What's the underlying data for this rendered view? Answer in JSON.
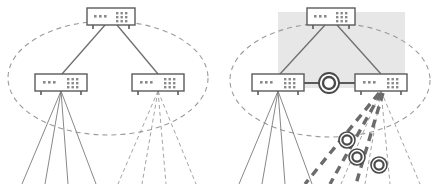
{
  "figure": {
    "caption": "",
    "background_color": "#ffffff",
    "width": 434,
    "height": 184
  },
  "style": {
    "device_stroke": "#5b5b5b",
    "device_fill": "#ffffff",
    "device_port_color": "#808080",
    "solid_link_color": "#6e6e6e",
    "dashed_link_color": "#9a9a9a",
    "thick_dashed_link_color": "#6b6b6b",
    "boundary_ellipse_color": "#9b9b9b",
    "highlight_region_fill": "#e6e6e6",
    "ring_node_outer_stroke": "#4a4a4a",
    "ring_node_inner_stroke": "#4a4a4a",
    "ring_node_fill": "#ffffff"
  },
  "panels": [
    {
      "id": "left-panel",
      "name": "baseline-topology",
      "label": "",
      "has_highlight_region": false,
      "boundary": {
        "name": "domain-boundary-ellipse",
        "cx": 108,
        "cy": 78,
        "rx": 100,
        "ry": 57,
        "dashed": true
      },
      "devices": [
        {
          "id": "L-root",
          "name": "core-switch",
          "x": 87,
          "y": 8,
          "w": 48,
          "h": 17,
          "left_ports": 3,
          "right_port_grid": [
            3,
            3
          ]
        },
        {
          "id": "L-left",
          "name": "edge-switch-left",
          "x": 35,
          "y": 74,
          "w": 52,
          "h": 17,
          "left_ports": 3,
          "right_port_grid": [
            3,
            3
          ]
        },
        {
          "id": "L-right",
          "name": "edge-switch-right",
          "x": 132,
          "y": 74,
          "w": 52,
          "h": 17,
          "left_ports": 3,
          "right_port_grid": [
            3,
            3
          ]
        }
      ],
      "uplinks": [
        {
          "name": "uplink-core-to-left",
          "from": "L-root",
          "to": "L-left",
          "style": "solid"
        },
        {
          "name": "uplink-core-to-right",
          "from": "L-root",
          "to": "L-right",
          "style": "solid"
        }
      ],
      "access_fans": [
        {
          "name": "access-fan-left",
          "origin_x": 61,
          "origin_y": 91,
          "style": "solid",
          "endpoints": [
            {
              "x": 22,
              "y": 184
            },
            {
              "x": 45,
              "y": 184
            },
            {
              "x": 68,
              "y": 184
            },
            {
              "x": 96,
              "y": 184
            }
          ]
        },
        {
          "name": "access-fan-right",
          "origin_x": 158,
          "origin_y": 91,
          "style": "dashed",
          "endpoints": [
            {
              "x": 118,
              "y": 184
            },
            {
              "x": 142,
              "y": 184
            },
            {
              "x": 166,
              "y": 184
            },
            {
              "x": 196,
              "y": 184
            }
          ]
        }
      ],
      "ring_nodes": []
    },
    {
      "id": "right-panel",
      "name": "enhanced-topology",
      "label": "",
      "has_highlight_region": true,
      "highlight_region": {
        "name": "highlighted-core-region",
        "x": 278,
        "y": 12,
        "w": 127,
        "h": 76
      },
      "boundary": {
        "name": "domain-boundary-ellipse",
        "cx": 330,
        "cy": 80,
        "rx": 100,
        "ry": 57,
        "dashed": true
      },
      "devices": [
        {
          "id": "R-root",
          "name": "core-switch",
          "x": 307,
          "y": 8,
          "w": 48,
          "h": 17,
          "left_ports": 3,
          "right_port_grid": [
            3,
            3
          ]
        },
        {
          "id": "R-left",
          "name": "edge-switch-left",
          "x": 252,
          "y": 74,
          "w": 52,
          "h": 17,
          "left_ports": 3,
          "right_port_grid": [
            3,
            3
          ]
        },
        {
          "id": "R-right",
          "name": "edge-switch-right",
          "x": 355,
          "y": 74,
          "w": 52,
          "h": 17,
          "left_ports": 3,
          "right_port_grid": [
            3,
            3
          ]
        }
      ],
      "uplinks": [
        {
          "name": "uplink-core-to-left",
          "from": "R-root",
          "to": "R-left",
          "style": "solid"
        },
        {
          "name": "uplink-core-to-right",
          "from": "R-root",
          "to": "R-right",
          "style": "solid"
        }
      ],
      "inter_switch_link": {
        "name": "inter-switch-link",
        "x1": 304,
        "y1": 83,
        "x2": 355,
        "y2": 83,
        "style": "solid-thick"
      },
      "access_fans": [
        {
          "name": "access-fan-left",
          "origin_x": 278,
          "origin_y": 91,
          "style": "solid",
          "endpoints": [
            {
              "x": 239,
              "y": 184
            },
            {
              "x": 262,
              "y": 184
            },
            {
              "x": 285,
              "y": 184
            },
            {
              "x": 312,
              "y": 184
            }
          ]
        },
        {
          "name": "access-fan-right",
          "origin_x": 381,
          "origin_y": 91,
          "style": "dashed",
          "endpoints": [
            {
              "x": 341,
              "y": 184
            },
            {
              "x": 365,
              "y": 184
            },
            {
              "x": 390,
              "y": 184
            },
            {
              "x": 420,
              "y": 184
            }
          ]
        }
      ],
      "thick_dashed_links": [
        {
          "name": "optical-link-1",
          "x1": 379,
          "y1": 93,
          "x2": 305,
          "y2": 184
        },
        {
          "name": "optical-link-2",
          "x1": 381,
          "y1": 93,
          "x2": 330,
          "y2": 184
        },
        {
          "name": "optical-link-3",
          "x1": 383,
          "y1": 93,
          "x2": 356,
          "y2": 184
        }
      ],
      "ring_nodes": [
        {
          "name": "ring-node-gateway",
          "cx": 329,
          "cy": 83,
          "r_outer": 10,
          "r_inner": 6
        },
        {
          "name": "ring-node-1",
          "cx": 347,
          "cy": 140,
          "r_outer": 8,
          "r_inner": 5
        },
        {
          "name": "ring-node-2",
          "cx": 357,
          "cy": 157,
          "r_outer": 8,
          "r_inner": 5
        },
        {
          "name": "ring-node-3",
          "cx": 379,
          "cy": 165,
          "r_outer": 8,
          "r_inner": 5
        }
      ]
    }
  ]
}
